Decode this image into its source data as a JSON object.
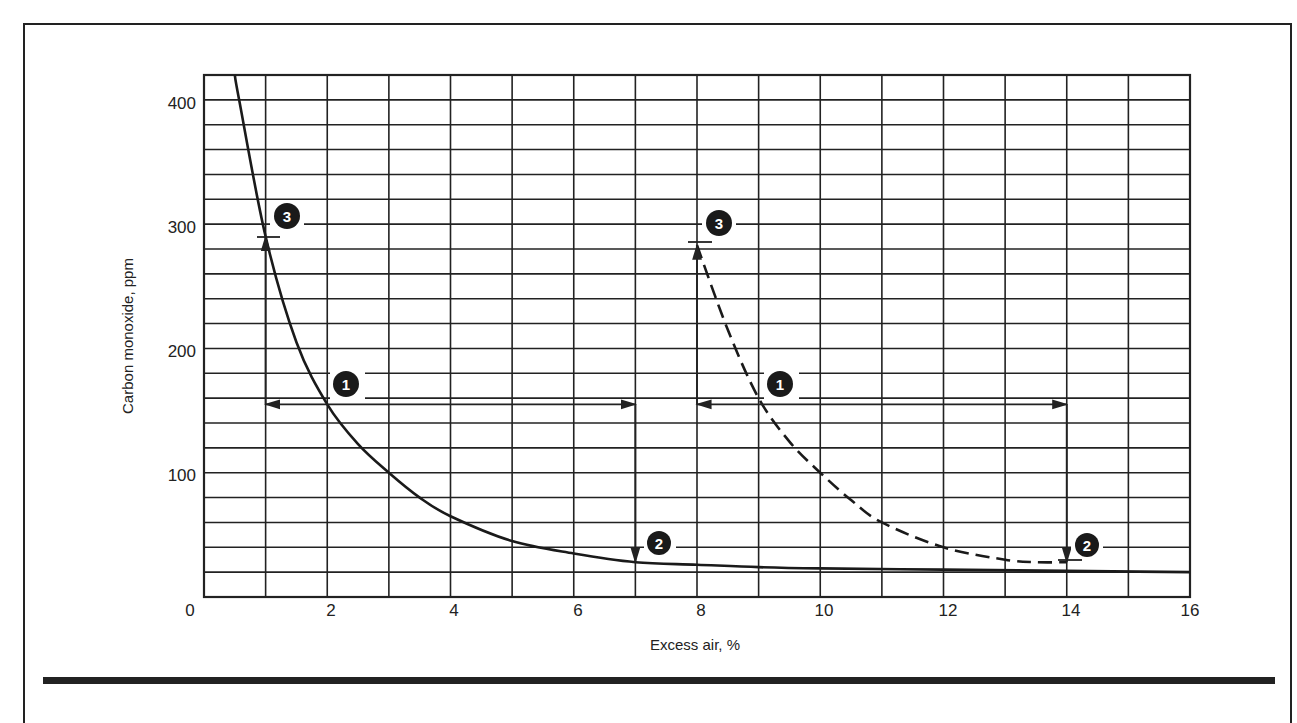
{
  "chart_data": {
    "type": "line",
    "title": "",
    "xlabel": "Excess air, %",
    "ylabel": "Carbon monoxide, ppm",
    "xlim": [
      0,
      16
    ],
    "ylim": [
      0,
      420
    ],
    "grid": true,
    "x_ticks": [
      0,
      2,
      4,
      6,
      8,
      10,
      12,
      14,
      16
    ],
    "y_ticks": [
      0,
      100,
      200,
      300,
      400
    ],
    "x_tick_labels": [
      "0",
      "2",
      "4",
      "6",
      "8",
      "10",
      "12",
      "14",
      "16"
    ],
    "y_tick_labels": [
      "100",
      "200",
      "300",
      "400"
    ],
    "x_minor_grid_step": 1,
    "y_minor_grid_step": 20,
    "series": [
      {
        "name": "Solid curve",
        "style": "solid",
        "x": [
          0.5,
          0.57,
          1.0,
          1.5,
          2.0,
          2.5,
          3.0,
          3.5,
          4.0,
          5.0,
          6.0,
          7.0,
          8.0,
          9.0,
          10.0,
          12.0,
          14.0,
          16.0
        ],
        "y": [
          420,
          400,
          290,
          205,
          155,
          123,
          100,
          80,
          65,
          45,
          35,
          28,
          26,
          24,
          23,
          22,
          21,
          20
        ]
      },
      {
        "name": "Dashed curve",
        "style": "dashed",
        "x": [
          8.0,
          8.5,
          9.0,
          9.5,
          10.0,
          10.5,
          11.0,
          12.0,
          13.0,
          13.5,
          14.0
        ],
        "y": [
          283,
          215,
          160,
          125,
          100,
          78,
          60,
          40,
          30,
          28,
          28
        ]
      }
    ],
    "annotations": [
      {
        "label": "1",
        "x": 2.2,
        "y": 175,
        "note": "marker near horizontal arrow, left curve"
      },
      {
        "label": "2",
        "x": 7.3,
        "y": 43,
        "note": "marker near vertical down arrow at x=7"
      },
      {
        "label": "3",
        "x": 1.3,
        "y": 308,
        "note": "marker near vertical up arrow at x=1"
      },
      {
        "label": "1",
        "x": 9.3,
        "y": 175,
        "note": "marker near horizontal arrow, right curve"
      },
      {
        "label": "2",
        "x": 14.3,
        "y": 43,
        "note": "marker near vertical down arrow at x=14"
      },
      {
        "label": "3",
        "x": 8.3,
        "y": 308,
        "note": "marker near vertical up arrow at x=8"
      }
    ],
    "guide_lines": [
      {
        "from": [
          1,
          155
        ],
        "to": [
          7,
          155
        ],
        "arrows": "both"
      },
      {
        "from": [
          7,
          155
        ],
        "to": [
          7,
          28
        ],
        "arrows": "end"
      },
      {
        "from": [
          1,
          155
        ],
        "to": [
          1,
          290
        ],
        "arrows": "end"
      },
      {
        "from": [
          8,
          155
        ],
        "to": [
          14,
          155
        ],
        "arrows": "both"
      },
      {
        "from": [
          14,
          155
        ],
        "to": [
          14,
          28
        ],
        "arrows": "end"
      },
      {
        "from": [
          8,
          155
        ],
        "to": [
          8,
          283
        ],
        "arrows": "end"
      }
    ]
  },
  "labels": {
    "xlabel": "Excess air, %",
    "ylabel": "Carbon monoxide, ppm",
    "x0": "0",
    "x2": "2",
    "x4": "4",
    "x6": "6",
    "x8": "8",
    "x10": "10",
    "x12": "12",
    "x14": "14",
    "x16": "16",
    "y100": "100",
    "y200": "200",
    "y300": "300",
    "y400": "400",
    "m1": "1",
    "m2": "2",
    "m3": "3"
  }
}
